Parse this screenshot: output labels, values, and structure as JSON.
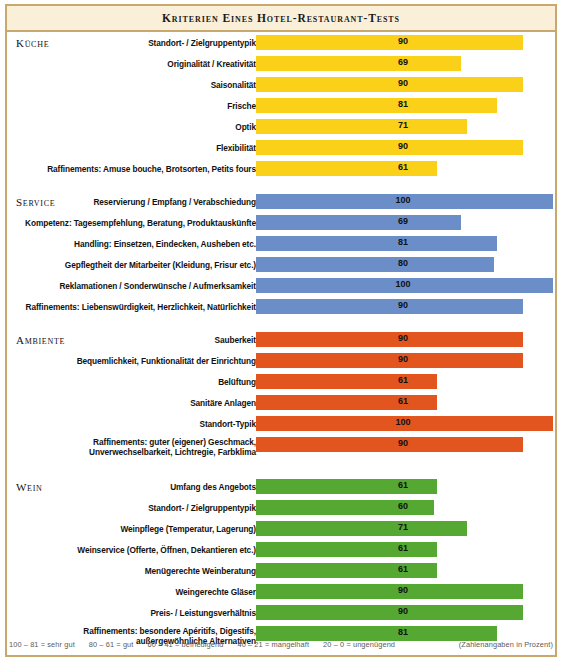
{
  "header": {
    "title": "Kriterien eines Hotel-Restaurant-Tests"
  },
  "colors": {
    "kueche": "#fbd019",
    "service": "#6b8ec9",
    "ambiente": "#e2551f",
    "wein": "#55a832",
    "gesamt": "#f7941e",
    "frame": "#c9a96b",
    "titlebar_bg": "#faf0da"
  },
  "gesamt": {
    "prefix": "(Ergebnis gerundet)",
    "label": "Gesamteindruck",
    "value": 79
  },
  "legend": {
    "scale": [
      "100 – 81 = sehr gut",
      "80 – 61 = gut",
      "60 – 41 = befriedigend",
      "40 – 21 = mangelhaft",
      "20 –   0 = ungenügend"
    ],
    "note": "(Zahlenangaben in Prozent)"
  },
  "chart_data": {
    "type": "bar",
    "title": "Kriterien eines Hotel-Restaurant-Tests",
    "xlabel": "",
    "ylabel": "",
    "xlim": [
      0,
      100
    ],
    "grid": false,
    "orientation": "horizontal",
    "unit": "Prozent",
    "sections": [
      {
        "name": "Küche",
        "color": "#fbd019",
        "items": [
          {
            "label": "Standort- / Zielgruppentypik",
            "value": 90
          },
          {
            "label": "Originalität / Kreativität",
            "value": 69
          },
          {
            "label": "Saisonalität",
            "value": 90
          },
          {
            "label": "Frische",
            "value": 81
          },
          {
            "label": "Optik",
            "value": 71
          },
          {
            "label": "Flexibilität",
            "value": 90
          },
          {
            "label": "Raffinements: Amuse bouche, Brotsorten, Petits fours",
            "value": 61
          }
        ]
      },
      {
        "name": "Service",
        "color": "#6b8ec9",
        "items": [
          {
            "label": "Reservierung / Empfang / Verabschiedung",
            "value": 100
          },
          {
            "label": "Kompetenz: Tagesempfehlung, Beratung, Produktauskünfte",
            "value": 69
          },
          {
            "label": "Handling: Einsetzen, Eindecken, Ausheben etc.",
            "value": 81
          },
          {
            "label": "Gepflegtheit der Mitarbeiter (Kleidung, Frisur etc.)",
            "value": 80
          },
          {
            "label": "Reklamationen / Sonderwünsche / Aufmerksamkeit",
            "value": 100
          },
          {
            "label": "Raffinements: Liebenswürdigkeit, Herzlichkeit, Natürlichkeit",
            "value": 90
          }
        ]
      },
      {
        "name": "Ambiente",
        "color": "#e2551f",
        "items": [
          {
            "label": "Sauberkeit",
            "value": 90
          },
          {
            "label": "Bequemlichkeit, Funktionalität der Einrichtung",
            "value": 90
          },
          {
            "label": "Belüftung",
            "value": 61
          },
          {
            "label": "Sanitäre Anlagen",
            "value": 61
          },
          {
            "label": "Standort-Typik",
            "value": 100
          },
          {
            "label": "Raffinements: guter (eigener) Geschmack, Unverwechselbarkeit, Lichtregie, Farbklima",
            "value": 90,
            "lines": 2
          }
        ]
      },
      {
        "name": "Wein",
        "color": "#55a832",
        "items": [
          {
            "label": "Umfang des Angebots",
            "value": 61
          },
          {
            "label": "Standort- / Zielgruppentypik",
            "value": 60
          },
          {
            "label": "Weinpflege (Temperatur, Lagerung)",
            "value": 71
          },
          {
            "label": "Weinservice (Offerte, Öffnen, Dekantieren etc.)",
            "value": 61
          },
          {
            "label": "Menügerechte Weinberatung",
            "value": 61
          },
          {
            "label": "Weingerechte Gläser",
            "value": 90
          },
          {
            "label": "Preis- / Leistungsverhältnis",
            "value": 90
          },
          {
            "label": "Raffinements: besondere Apéritifs, Digestifs, außergewöhnliche Alternativen",
            "value": 81,
            "lines": 2
          }
        ]
      }
    ],
    "summary": {
      "label": "Gesamteindruck",
      "value": 79,
      "color": "#f7941e"
    }
  }
}
